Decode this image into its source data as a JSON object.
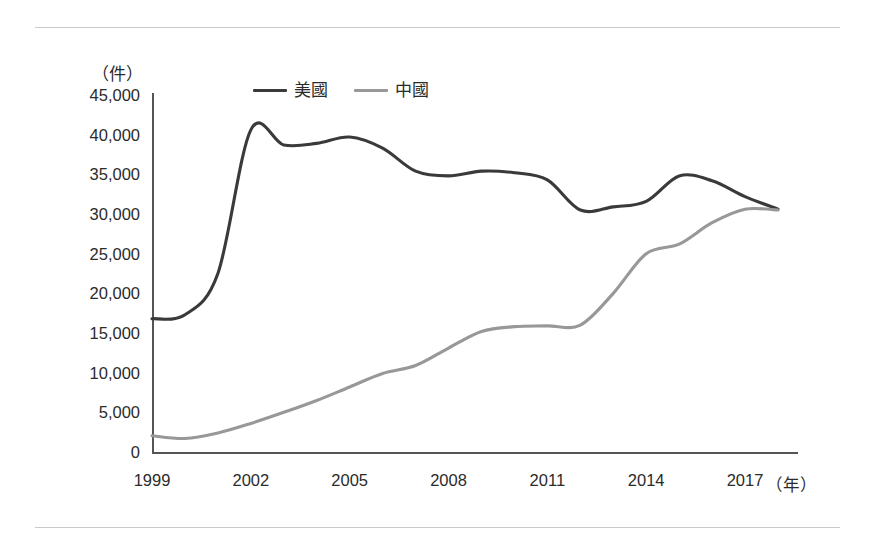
{
  "chart_data": {
    "type": "line",
    "title": "",
    "xlabel": "（年）",
    "ylabel": "（件）",
    "unit_label": "（件）",
    "xaxis_unit": "（年）",
    "xlim": [
      1999,
      2018
    ],
    "ylim": [
      0,
      45000
    ],
    "ytick_step": 5000,
    "grid": false,
    "legend_position": "top-center",
    "ytick_labels": [
      "45,000",
      "40,000",
      "35,000",
      "30,000",
      "25,000",
      "20,000",
      "15,000",
      "10,000",
      "5,000",
      "0"
    ],
    "ytick_values": [
      45000,
      40000,
      35000,
      30000,
      25000,
      20000,
      15000,
      10000,
      5000,
      0
    ],
    "xtick_labels": [
      "1999",
      "2002",
      "2005",
      "2008",
      "2011",
      "2014",
      "2017"
    ],
    "xtick_values": [
      1999,
      2002,
      2005,
      2008,
      2011,
      2014,
      2017
    ],
    "x": [
      1999,
      2000,
      2001,
      2002,
      2003,
      2004,
      2005,
      2006,
      2007,
      2008,
      2009,
      2010,
      2011,
      2012,
      2013,
      2014,
      2015,
      2016,
      2017,
      2018
    ],
    "series": [
      {
        "name": "美國",
        "color": "#3a3a3a",
        "values": [
          16800,
          17300,
          22500,
          40600,
          38700,
          38900,
          39700,
          38300,
          35400,
          34800,
          35400,
          35200,
          34300,
          30500,
          30900,
          31600,
          34800,
          34200,
          32200,
          30600
        ]
      },
      {
        "name": "中國",
        "color": "#989898",
        "values": [
          2050,
          1700,
          2400,
          3600,
          5000,
          6500,
          8200,
          9900,
          10900,
          13100,
          15200,
          15800,
          15900,
          16000,
          20000,
          25000,
          26200,
          28900,
          30600,
          30500
        ]
      }
    ]
  },
  "legend": {
    "items": [
      {
        "label": "美國",
        "color": "#3a3a3a",
        "icon": "line-swatch-dark"
      },
      {
        "label": "中國",
        "color": "#989898",
        "icon": "line-swatch-gray"
      }
    ]
  },
  "axes": {
    "y_unit": "（件）",
    "x_unit": "（年）"
  },
  "colors": {
    "us_line": "#3a3a3a",
    "china_line": "#989898",
    "axis": "#555555",
    "rule": "#c9c9c9",
    "text": "#2b2b2b",
    "background": "#ffffff"
  }
}
